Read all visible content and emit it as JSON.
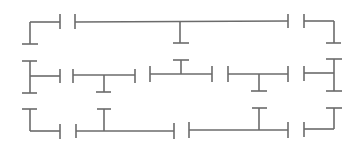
{
  "canvas": {
    "width": 361,
    "height": 153,
    "background": "#ffffff",
    "stroke": "#6b6b6b"
  },
  "pieces": [
    {
      "name": "piece-r1-c1",
      "lines": [
        [
          30,
          22,
          60,
          22
        ],
        [
          30,
          22,
          30,
          44
        ],
        [
          22,
          44,
          38,
          44
        ],
        [
          60,
          14,
          60,
          29
        ]
      ]
    },
    {
      "name": "piece-r1-c2",
      "lines": [
        [
          75,
          14,
          75,
          29
        ],
        [
          75,
          22,
          288,
          21
        ],
        [
          180,
          22,
          180,
          43
        ],
        [
          173,
          43,
          189,
          43
        ],
        [
          288,
          14,
          288,
          28
        ]
      ]
    },
    {
      "name": "piece-r1-c3",
      "lines": [
        [
          304,
          14,
          304,
          28
        ],
        [
          304,
          21,
          334,
          21
        ],
        [
          334,
          21,
          334,
          43
        ],
        [
          326,
          43,
          341,
          43
        ]
      ]
    },
    {
      "name": "piece-r2-c1",
      "lines": [
        [
          30,
          61,
          30,
          93
        ],
        [
          22,
          61,
          37,
          61
        ],
        [
          22,
          93,
          37,
          93
        ],
        [
          30,
          76,
          60,
          76
        ],
        [
          60,
          69,
          60,
          83
        ]
      ]
    },
    {
      "name": "piece-r2-c2",
      "lines": [
        [
          73,
          69,
          73,
          83
        ],
        [
          73,
          75,
          135,
          75
        ],
        [
          135,
          69,
          135,
          83
        ],
        [
          104,
          75,
          104,
          92
        ],
        [
          96,
          92,
          111,
          92
        ]
      ]
    },
    {
      "name": "piece-r2-c3",
      "lines": [
        [
          150,
          66,
          150,
          82
        ],
        [
          150,
          74,
          212,
          74
        ],
        [
          212,
          66,
          212,
          82
        ],
        [
          181,
          74,
          181,
          60
        ],
        [
          173,
          60,
          189,
          60
        ]
      ]
    },
    {
      "name": "piece-r2-c4",
      "lines": [
        [
          228,
          66,
          228,
          82
        ],
        [
          228,
          74,
          288,
          74
        ],
        [
          288,
          66,
          288,
          82
        ],
        [
          259,
          74,
          259,
          91
        ],
        [
          251,
          91,
          267,
          91
        ]
      ]
    },
    {
      "name": "piece-r2-c5",
      "lines": [
        [
          304,
          66,
          304,
          81
        ],
        [
          304,
          73,
          334,
          73
        ],
        [
          334,
          59,
          334,
          91
        ],
        [
          326,
          59,
          342,
          59
        ],
        [
          326,
          91,
          342,
          91
        ]
      ]
    },
    {
      "name": "piece-r3-c1",
      "lines": [
        [
          22,
          109,
          37,
          109
        ],
        [
          30,
          109,
          30,
          131
        ],
        [
          30,
          131,
          60,
          131
        ],
        [
          60,
          124,
          60,
          139
        ]
      ]
    },
    {
      "name": "piece-r3-c2",
      "lines": [
        [
          76,
          124,
          76,
          138
        ],
        [
          76,
          131,
          174,
          131
        ],
        [
          174,
          123,
          174,
          139
        ],
        [
          104,
          131,
          104,
          109
        ],
        [
          97,
          109,
          111,
          109
        ]
      ]
    },
    {
      "name": "piece-r3-c3",
      "lines": [
        [
          189,
          122,
          189,
          138
        ],
        [
          189,
          130,
          288,
          130
        ],
        [
          288,
          122,
          288,
          138
        ],
        [
          259,
          130,
          259,
          108
        ],
        [
          252,
          108,
          267,
          108
        ]
      ]
    },
    {
      "name": "piece-r3-c4",
      "lines": [
        [
          304,
          122,
          304,
          137
        ],
        [
          304,
          129,
          334,
          129
        ],
        [
          334,
          129,
          334,
          108
        ],
        [
          326,
          108,
          342,
          108
        ]
      ]
    }
  ]
}
